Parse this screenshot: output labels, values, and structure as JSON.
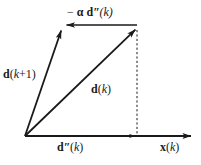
{
  "figure": {
    "background_color": "#ffffff",
    "stroke_color": "#1a1a1a",
    "width": 201,
    "height": 165,
    "labels": {
      "minus_alpha_d_second_k": {
        "minus": "−",
        "alpha": "α",
        "vector": "d",
        "primes": "″",
        "arg": "(k)",
        "full_text": "− α d″(k)"
      },
      "d_k_plus_1": {
        "vector": "d",
        "arg_open": "(",
        "arg_var": "k",
        "arg_rest": "+1)",
        "full_text": "d(k+1)"
      },
      "d_k": {
        "vector": "d",
        "arg_open": "(",
        "arg_var": "k",
        "arg_close": ")",
        "full_text": "d(k)"
      },
      "d_second_k": {
        "vector": "d",
        "primes": "″",
        "arg_open": "(",
        "arg_var": "k",
        "arg_close": ")",
        "full_text": "d″(k)"
      },
      "x_k": {
        "vector": "x",
        "arg_open": "(",
        "arg_var": "k",
        "arg_close": ")",
        "full_text": "x(k)"
      }
    },
    "geometry": {
      "origin": {
        "x": 25,
        "y": 136
      },
      "axis_end": {
        "x": 193,
        "y": 136
      },
      "d_k_tip": {
        "x": 137,
        "y": 28
      },
      "d_k_plus_1_tip": {
        "x": 62,
        "y": 27
      },
      "d_second_k_tip": {
        "x": 137,
        "y": 136
      },
      "alpha_arrow_start": {
        "x": 136,
        "y": 25
      },
      "alpha_arrow_tip": {
        "x": 62,
        "y": 25
      },
      "dashed_line": {
        "x": 137,
        "y_top": 30,
        "y_bottom": 134
      }
    }
  }
}
